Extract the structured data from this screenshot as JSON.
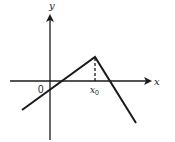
{
  "diagram": {
    "axis_x_label": "x",
    "axis_y_label": "y",
    "origin_label": "0",
    "point_label": "x",
    "point_subscript": "0",
    "line_color": "#1a1a1a"
  }
}
